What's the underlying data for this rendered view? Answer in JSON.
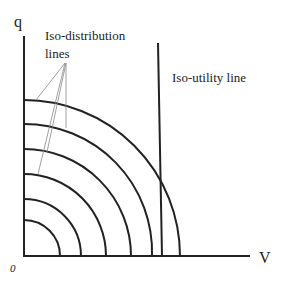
{
  "diagram": {
    "y_axis_label": "q",
    "x_axis_label": "V",
    "origin_label": "0",
    "iso_distribution_label_line1": "Iso-distribution",
    "iso_distribution_label_line2": "lines",
    "iso_utility_label": "Iso-utility line",
    "arc_count": 6,
    "line_color": "#222222",
    "leader_color": "#888888"
  }
}
